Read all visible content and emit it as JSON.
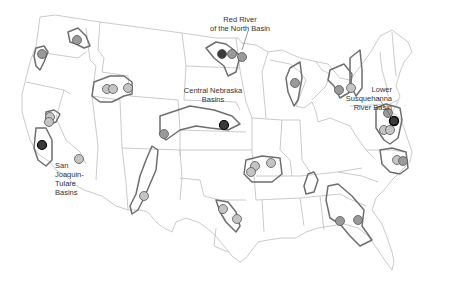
{
  "map": {
    "title": "",
    "colors": {
      "background": "#ffffff",
      "state_lines": "#bdbdbd",
      "basin_outline": "#6e6e6e",
      "circle_light": "#c4c4c4",
      "circle_medium": "#9a9a9a",
      "circle_dark": "#3a3a3a"
    },
    "labels": [
      {
        "id": "red-river",
        "lines": [
          "Red River",
          "of the North Basin"
        ]
      },
      {
        "id": "central-nebraska",
        "lines": [
          "Central Nebraska",
          "Basins"
        ]
      },
      {
        "id": "lower-susquehanna",
        "lines": [
          "Lower",
          "Susquehanna",
          "River Basin"
        ]
      },
      {
        "id": "san-joaquin",
        "lines": [
          "San",
          "Joaquin-",
          "Tulare",
          "Basins"
        ]
      }
    ],
    "sites": [
      {
        "x": 77,
        "y": 40,
        "shade": "medium"
      },
      {
        "x": 42,
        "y": 54,
        "shade": "medium"
      },
      {
        "x": 107,
        "y": 89,
        "shade": "light"
      },
      {
        "x": 113,
        "y": 89,
        "shade": "light"
      },
      {
        "x": 128,
        "y": 88,
        "shade": "light"
      },
      {
        "x": 50,
        "y": 117,
        "shade": "light"
      },
      {
        "x": 49,
        "y": 122,
        "shade": "light"
      },
      {
        "x": 42,
        "y": 145,
        "shade": "dark"
      },
      {
        "x": 79,
        "y": 159,
        "shade": "light"
      },
      {
        "x": 164,
        "y": 134,
        "shade": "medium"
      },
      {
        "x": 224,
        "y": 125,
        "shade": "dark"
      },
      {
        "x": 222,
        "y": 54,
        "shade": "dark"
      },
      {
        "x": 232,
        "y": 54,
        "shade": "medium"
      },
      {
        "x": 242,
        "y": 57,
        "shade": "medium"
      },
      {
        "x": 295,
        "y": 83,
        "shade": "medium"
      },
      {
        "x": 144,
        "y": 196,
        "shade": "light"
      },
      {
        "x": 255,
        "y": 166,
        "shade": "light"
      },
      {
        "x": 251,
        "y": 172,
        "shade": "light"
      },
      {
        "x": 271,
        "y": 163,
        "shade": "light"
      },
      {
        "x": 223,
        "y": 209,
        "shade": "light"
      },
      {
        "x": 237,
        "y": 219,
        "shade": "light"
      },
      {
        "x": 237,
        "y": 218,
        "shade": "light"
      },
      {
        "x": 339,
        "y": 90,
        "shade": "medium"
      },
      {
        "x": 351,
        "y": 88,
        "shade": "light"
      },
      {
        "x": 388,
        "y": 113,
        "shade": "medium"
      },
      {
        "x": 394,
        "y": 121,
        "shade": "dark"
      },
      {
        "x": 384,
        "y": 130,
        "shade": "light"
      },
      {
        "x": 390,
        "y": 130,
        "shade": "light"
      },
      {
        "x": 397,
        "y": 160,
        "shade": "light"
      },
      {
        "x": 403,
        "y": 161,
        "shade": "medium"
      },
      {
        "x": 340,
        "y": 221,
        "shade": "medium"
      },
      {
        "x": 358,
        "y": 220,
        "shade": "medium"
      },
      {
        "x": 238,
        "y": 218,
        "shade": "light"
      }
    ]
  }
}
